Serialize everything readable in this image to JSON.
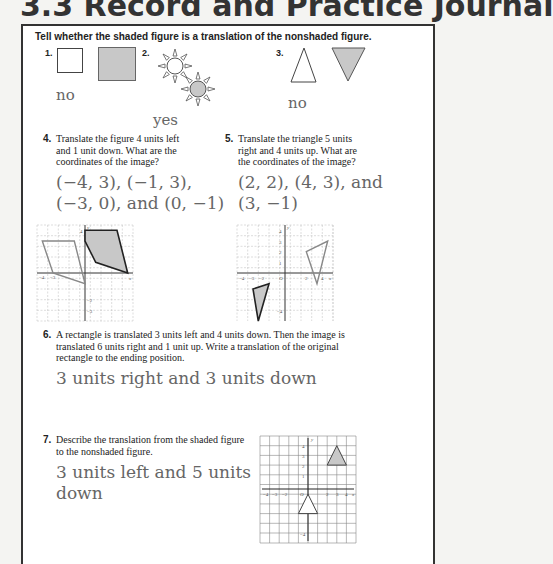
{
  "header": {
    "title": "3.3 Record and Practice Journal"
  },
  "instructions": "Tell whether the shaded figure is a translation of the nonshaded figure.",
  "problems": [
    {
      "number": "1.",
      "answer": "no"
    },
    {
      "number": "2.",
      "answer": "yes"
    },
    {
      "number": "3.",
      "answer": "no"
    },
    {
      "number": "4.",
      "question": [
        "Translate the figure 4 units left",
        "and 1 unit down. What are the",
        "coordinates of the image?"
      ],
      "answer_lines": [
        "(−4, 3), (−1, 3),",
        "(−3, 0), and (0, −1)"
      ]
    },
    {
      "number": "5.",
      "question": [
        "Translate the triangle 5 units",
        "right and 4 units up. What are",
        "the coordinates of the image?"
      ],
      "answer_lines": [
        "(2, 2), (4, 3), and",
        "(3, −1)"
      ]
    },
    {
      "number": "6.",
      "question": [
        "A rectangle is translated 3 units left and 4 units down. Then the image is",
        "translated 6 units right and 1 unit up. Write a translation of the original",
        "rectangle to the ending position."
      ],
      "answer": "3 units right and 3 units down"
    },
    {
      "number": "7.",
      "question": [
        "Describe the translation from the shaded figure",
        "to the nonshaded figure."
      ],
      "answer_lines": [
        "3 units left and 5 units",
        "down"
      ]
    }
  ],
  "graph_labels": {
    "x": "x",
    "y": "y",
    "origin": "O",
    "xticks": [
      "−4",
      "−3",
      "−2",
      "2",
      "3",
      "4"
    ],
    "yticks": [
      "4",
      "3",
      "2",
      "1",
      "−2",
      "−3",
      "−4"
    ]
  },
  "colors": {
    "answer": "#666666",
    "shade": "#c8c8c8",
    "border": "#333333"
  }
}
